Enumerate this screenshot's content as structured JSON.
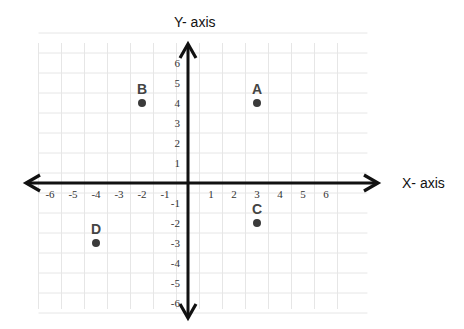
{
  "chart_data": {
    "type": "scatter",
    "title": "",
    "xlabel": "X- axis",
    "ylabel": "Y- axis",
    "xlim": [
      -6,
      6
    ],
    "ylim": [
      -6,
      6
    ],
    "grid": true,
    "x_ticks": [
      -6,
      -5,
      -4,
      -3,
      -2,
      -1,
      1,
      2,
      3,
      4,
      5,
      6
    ],
    "y_ticks": [
      6,
      5,
      4,
      3,
      2,
      1,
      -1,
      -2,
      -3,
      -4,
      -5,
      -6
    ],
    "points": [
      {
        "label": "A",
        "x": 3,
        "y": 4
      },
      {
        "label": "B",
        "x": -2,
        "y": 4
      },
      {
        "label": "C",
        "x": 3,
        "y": -2
      },
      {
        "label": "D",
        "x": -4,
        "y": -3
      }
    ]
  },
  "colors": {
    "axis": "#111111",
    "grid": "#e6e6e6",
    "point": "#3a3a3a",
    "tick_text": "#333333"
  }
}
